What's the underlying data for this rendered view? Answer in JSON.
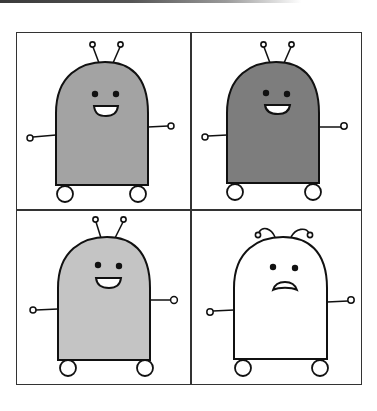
{
  "figure": {
    "layout": "2x2 grid",
    "stroke_color": "#111111",
    "panels": [
      {
        "position": "top-left",
        "body_fill": "#a3a3a3",
        "expression": "smile",
        "antennae": "upright"
      },
      {
        "position": "top-right",
        "body_fill": "#7d7d7d",
        "expression": "smile",
        "antennae": "upright"
      },
      {
        "position": "bottom-left",
        "body_fill": "#c4c4c4",
        "expression": "smile",
        "antennae": "upright"
      },
      {
        "position": "bottom-right",
        "body_fill": "#ffffff",
        "expression": "worried",
        "antennae": "drooping"
      }
    ]
  }
}
